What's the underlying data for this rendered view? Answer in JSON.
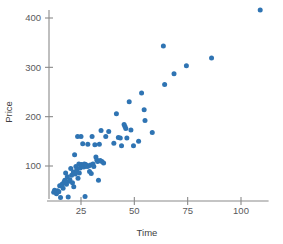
{
  "chart_data": {
    "type": "scatter",
    "title": "",
    "xlabel": "Time",
    "ylabel": "Price",
    "xlim": [
      10,
      112
    ],
    "ylim": [
      28,
      432
    ],
    "xticks": [
      25,
      50,
      75,
      100
    ],
    "yticks": [
      100,
      200,
      300,
      400
    ],
    "xtick_labels": [
      "25",
      "50",
      "75",
      "100"
    ],
    "ytick_labels": [
      "100",
      "200",
      "300",
      "400"
    ],
    "grid": false,
    "legend": null,
    "point_color": "#2f74b3",
    "axis_color": "#8a8a8a",
    "background": "#ffffff",
    "n_points": 86,
    "points": [
      [
        12.2,
        47
      ],
      [
        12.6,
        51
      ],
      [
        13.5,
        44
      ],
      [
        14.0,
        50
      ],
      [
        14.6,
        48
      ],
      [
        15.0,
        60
      ],
      [
        15.4,
        36
      ],
      [
        16.1,
        63
      ],
      [
        16.6,
        55
      ],
      [
        17.0,
        67
      ],
      [
        17.4,
        71
      ],
      [
        17.8,
        86
      ],
      [
        18.2,
        63
      ],
      [
        18.6,
        78
      ],
      [
        19.0,
        37
      ],
      [
        19.4,
        69
      ],
      [
        19.8,
        72
      ],
      [
        20.2,
        95
      ],
      [
        20.6,
        81
      ],
      [
        21.0,
        66
      ],
      [
        21.4,
        88
      ],
      [
        21.6,
        58
      ],
      [
        22.0,
        123
      ],
      [
        22.3,
        84
      ],
      [
        22.6,
        99
      ],
      [
        23.0,
        92
      ],
      [
        23.4,
        160
      ],
      [
        23.6,
        75
      ],
      [
        24.0,
        104
      ],
      [
        24.2,
        86
      ],
      [
        24.6,
        96
      ],
      [
        25.0,
        160
      ],
      [
        25.2,
        103
      ],
      [
        25.6,
        102
      ],
      [
        25.8,
        145
      ],
      [
        26.0,
        100
      ],
      [
        26.3,
        98
      ],
      [
        26.6,
        104
      ],
      [
        26.9,
        38
      ],
      [
        27.2,
        103
      ],
      [
        27.5,
        101
      ],
      [
        27.8,
        99
      ],
      [
        28.2,
        144
      ],
      [
        28.6,
        100
      ],
      [
        29.0,
        89
      ],
      [
        29.4,
        102
      ],
      [
        29.8,
        85
      ],
      [
        30.2,
        160
      ],
      [
        30.6,
        104
      ],
      [
        31.0,
        99
      ],
      [
        31.5,
        143
      ],
      [
        32.0,
        118
      ],
      [
        32.4,
        112
      ],
      [
        32.8,
        109
      ],
      [
        33.2,
        71
      ],
      [
        33.6,
        144
      ],
      [
        34.0,
        111
      ],
      [
        34.4,
        172
      ],
      [
        34.8,
        109
      ],
      [
        35.6,
        106
      ],
      [
        36.6,
        160
      ],
      [
        38.0,
        170
      ],
      [
        40.4,
        146
      ],
      [
        41.6,
        206
      ],
      [
        42.5,
        158
      ],
      [
        43.4,
        157
      ],
      [
        44.0,
        141
      ],
      [
        45.2,
        184
      ],
      [
        45.6,
        180
      ],
      [
        46.0,
        176
      ],
      [
        46.5,
        157
      ],
      [
        47.6,
        230
      ],
      [
        48.4,
        173
      ],
      [
        49.6,
        141
      ],
      [
        52.0,
        150
      ],
      [
        53.4,
        248
      ],
      [
        54.6,
        214
      ],
      [
        55.0,
        192
      ],
      [
        58.4,
        168
      ],
      [
        63.6,
        343
      ],
      [
        64.2,
        265
      ],
      [
        68.6,
        287
      ],
      [
        74.4,
        303
      ],
      [
        86.2,
        319
      ],
      [
        109.0,
        416
      ]
    ]
  },
  "axis_titles": {
    "x": "Time",
    "y": "Price"
  }
}
